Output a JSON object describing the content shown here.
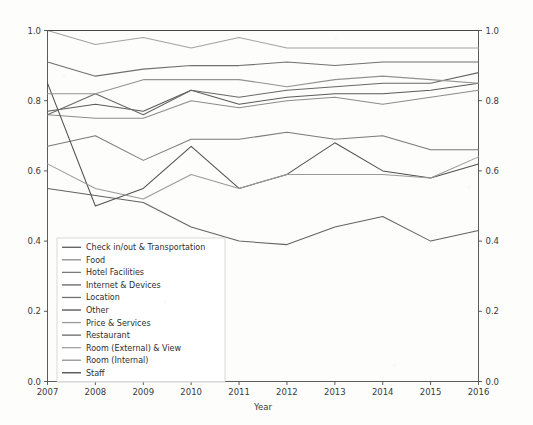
{
  "chart_data": {
    "type": "line",
    "title": "",
    "xlabel": "Year",
    "ylabel": "",
    "x": [
      2007,
      2008,
      2009,
      2010,
      2011,
      2012,
      2013,
      2014,
      2015,
      2016
    ],
    "xtick_labels": [
      "2007",
      "2008",
      "2009",
      "2010",
      "2011",
      "2012",
      "2013",
      "2014",
      "2015",
      "2016"
    ],
    "ytick_labels": [
      "0.0",
      "0.2",
      "0.4",
      "0.6",
      "0.8",
      "1.0"
    ],
    "ytick_values": [
      0.0,
      0.2,
      0.4,
      0.6,
      0.8,
      1.0
    ],
    "xlim": [
      2007,
      2016
    ],
    "ylim": [
      0.0,
      1.0
    ],
    "grid": false,
    "legend_position": "lower left",
    "right_axis_mirrored": true,
    "right_ytick_labels": [
      "0.0",
      "0.2",
      "0.4",
      "0.6",
      "0.8",
      "1.0"
    ],
    "series": [
      {
        "name": "Check in/out & Transportation",
        "color": "#5b5b5b",
        "values": [
          0.77,
          0.79,
          0.77,
          0.83,
          0.79,
          0.81,
          0.82,
          0.82,
          0.83,
          0.85
        ]
      },
      {
        "name": "Food",
        "color": "#8c8c8c",
        "values": [
          0.76,
          0.75,
          0.75,
          0.8,
          0.78,
          0.8,
          0.81,
          0.79,
          0.81,
          0.83
        ]
      },
      {
        "name": "Hotel Facilities",
        "color": "#7a7a7a",
        "values": [
          0.67,
          0.7,
          0.63,
          0.69,
          0.69,
          0.71,
          0.69,
          0.7,
          0.66,
          0.66
        ]
      },
      {
        "name": "Internet & Devices",
        "color": "#636363",
        "values": [
          0.55,
          0.53,
          0.51,
          0.44,
          0.4,
          0.39,
          0.44,
          0.47,
          0.4,
          0.43
        ]
      },
      {
        "name": "Location",
        "color": "#707070",
        "values": [
          0.91,
          0.87,
          0.89,
          0.9,
          0.9,
          0.91,
          0.9,
          0.91,
          0.91,
          0.91
        ]
      },
      {
        "name": "Other",
        "color": "#4f4f4f",
        "values": [
          0.85,
          0.5,
          0.55,
          0.67,
          0.55,
          0.59,
          0.68,
          0.6,
          0.58,
          0.62
        ]
      },
      {
        "name": "Price & Services",
        "color": "#9a9a9a",
        "values": [
          0.62,
          0.55,
          0.52,
          0.59,
          0.55,
          0.59,
          0.59,
          0.59,
          0.58,
          0.64
        ]
      },
      {
        "name": "Restaurant",
        "color": "#686868",
        "values": [
          0.76,
          0.82,
          0.76,
          0.83,
          0.81,
          0.83,
          0.84,
          0.85,
          0.85,
          0.88
        ]
      },
      {
        "name": "Room (External) & View",
        "color": "#a3a3a3",
        "values": [
          1.0,
          0.96,
          0.98,
          0.95,
          0.98,
          0.95,
          0.95,
          0.95,
          0.95,
          0.95
        ]
      },
      {
        "name": "Room (Internal)",
        "color": "#929292",
        "values": [
          0.82,
          0.82,
          0.86,
          0.86,
          0.86,
          0.84,
          0.86,
          0.87,
          0.86,
          0.85
        ]
      },
      {
        "name": "Staff",
        "color": "#454545",
        "values": [
          1.0,
          1.0,
          1.0,
          1.0,
          1.0,
          1.0,
          1.0,
          1.0,
          1.0,
          1.0
        ]
      }
    ]
  }
}
